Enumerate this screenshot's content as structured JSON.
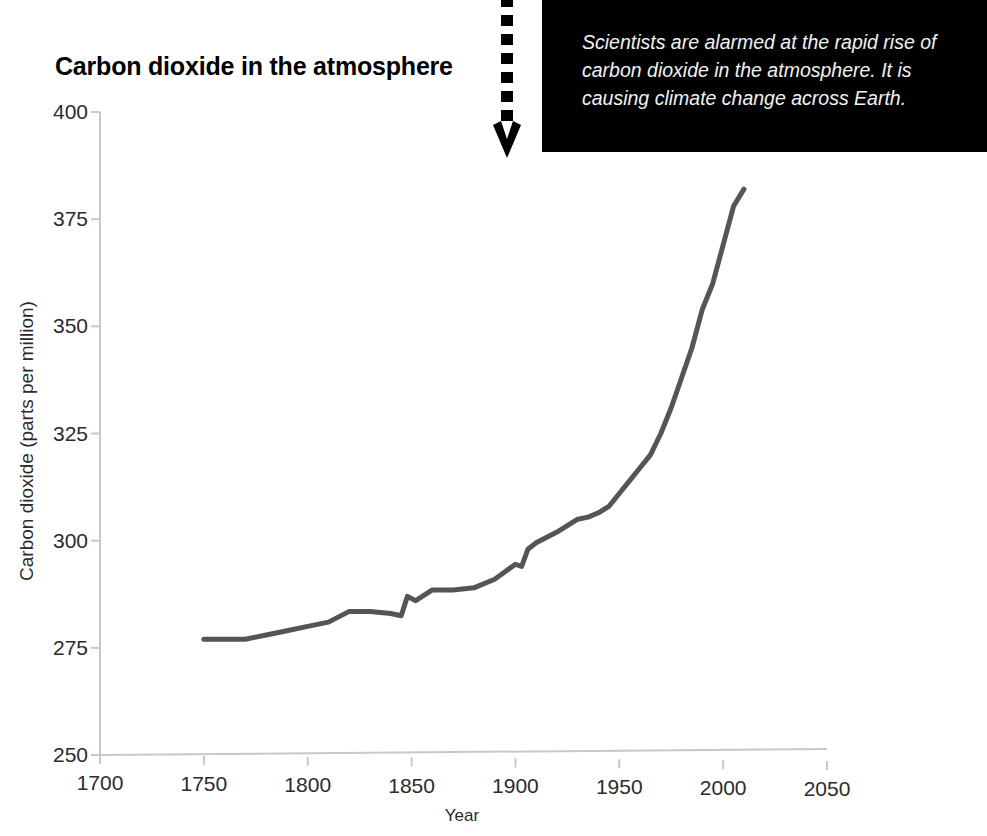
{
  "chart_data": {
    "type": "line",
    "title": "Carbon dioxide in the atmosphere",
    "xlabel": "Year",
    "ylabel": "Carbon dioxide (parts per million)",
    "xlim": [
      1700,
      2050
    ],
    "ylim": [
      250,
      400
    ],
    "xticks": [
      1700,
      1750,
      1800,
      1850,
      1900,
      1950,
      2000,
      2050
    ],
    "xtick_labels": [
      "1700",
      "1750",
      "1800",
      "1850",
      "1900",
      "1950",
      "2000",
      "2050"
    ],
    "yticks": [
      250,
      275,
      300,
      325,
      350,
      375,
      400
    ],
    "ytick_labels": [
      "250",
      "275",
      "300",
      "325",
      "350",
      "375",
      "400"
    ],
    "grid": false,
    "legend": false,
    "line_color": "#555555",
    "line_width": 5,
    "series": [
      {
        "name": "Atmospheric CO2",
        "x": [
          1750,
          1760,
          1770,
          1780,
          1790,
          1800,
          1810,
          1820,
          1830,
          1840,
          1845,
          1848,
          1852,
          1860,
          1870,
          1880,
          1890,
          1900,
          1903,
          1906,
          1910,
          1920,
          1930,
          1935,
          1940,
          1945,
          1950,
          1955,
          1960,
          1965,
          1970,
          1975,
          1980,
          1985,
          1990,
          1995,
          2000,
          2005,
          2010
        ],
        "y": [
          277,
          277,
          277,
          278,
          279,
          280,
          281,
          283.5,
          283.5,
          283,
          282.5,
          287,
          286,
          288.5,
          288.5,
          289,
          291,
          294.5,
          294,
          298,
          299.5,
          302,
          305,
          305.5,
          306.5,
          308,
          311,
          314,
          317,
          320,
          325,
          331,
          338,
          345,
          354,
          360,
          369,
          378,
          382
        ]
      }
    ]
  },
  "callout": {
    "text": "Scientists are alarmed at the rapid rise of carbon dioxide in the atmosphere. It is causing climate change across Earth.",
    "background_color": "#000000",
    "text_color": "#f2f2f2",
    "arrow": "dotted-down-arrow"
  }
}
